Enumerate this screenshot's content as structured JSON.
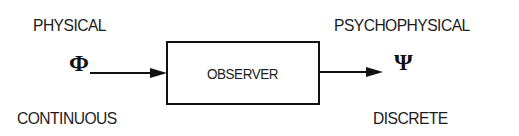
{
  "diagram": {
    "left": {
      "domain_label": "PHYSICAL",
      "symbol": "Φ",
      "symbol_name": "Phi",
      "nature_label": "CONTINUOUS"
    },
    "center": {
      "box_label": "OBSERVER"
    },
    "right": {
      "domain_label": "PSYCHOPHYSICAL",
      "symbol": "Ψ",
      "symbol_name": "Psi",
      "nature_label": "DISCRETE"
    },
    "flow": [
      "Φ",
      "OBSERVER",
      "Ψ"
    ],
    "colors": {
      "background": "#ffffff",
      "ink": "#111111"
    }
  }
}
